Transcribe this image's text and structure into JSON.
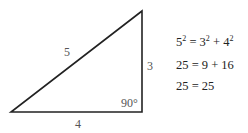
{
  "diagram": {
    "triangle": {
      "hypotenuse_label": "5",
      "vertical_leg_label": "3",
      "horizontal_leg_label": "4",
      "right_angle_label": "90°"
    },
    "equations": [
      {
        "lhs_base": "5",
        "lhs_exp": "2",
        "eq": " = ",
        "a_base": "3",
        "a_exp": "2",
        "plus": " + ",
        "b_base": "4",
        "b_exp": "2"
      },
      {
        "text": "25 = 9 + 16"
      },
      {
        "text": "25 = 25"
      }
    ],
    "colors": {
      "line": "#222222",
      "label": "#555555",
      "text": "#222222"
    }
  }
}
